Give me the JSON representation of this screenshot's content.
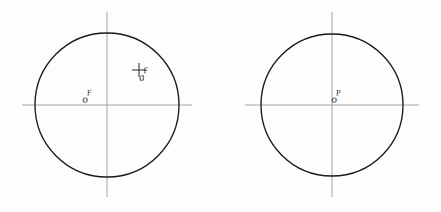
{
  "figure": {
    "background_color": "#fdfdfd",
    "circle_color": "#1a1a1a",
    "axis_color": "#9a9a9a",
    "label_color": "#2c2c2c"
  },
  "views": [
    {
      "name": "front-view",
      "center": {
        "x": 107,
        "y": 105
      },
      "radius": 72,
      "center_label": {
        "base": "o",
        "sup": "F",
        "text": "oF"
      },
      "points": [
        {
          "name": "point-a",
          "marker": "cross",
          "x": 139,
          "y": 70,
          "label": {
            "base": "a",
            "sup": "F",
            "text": "aF"
          }
        }
      ],
      "axes": {
        "horizontal": {
          "x1": 22,
          "y1": 105,
          "x2": 192,
          "y2": 105
        },
        "vertical": {
          "x1": 107,
          "y1": 12,
          "x2": 107,
          "y2": 197
        }
      }
    },
    {
      "name": "profile-view",
      "center": {
        "x": 332,
        "y": 105
      },
      "radius": 71,
      "center_label": {
        "base": "o",
        "sup": "P",
        "text": "oP"
      },
      "points": [],
      "axes": {
        "horizontal": {
          "x1": 245,
          "y1": 105,
          "x2": 419,
          "y2": 105
        },
        "vertical": {
          "x1": 332,
          "y1": 12,
          "x2": 332,
          "y2": 197
        }
      }
    }
  ]
}
